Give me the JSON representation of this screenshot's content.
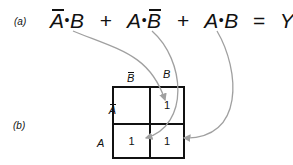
{
  "diagram": {
    "part_a_label": "(a)",
    "part_b_label": "(b)",
    "equation": {
      "term1": {
        "var1": "A",
        "var1_complement": true,
        "dot": "•",
        "var2": "B",
        "var2_complement": false
      },
      "plus1": "+",
      "term2": {
        "var1": "A",
        "var1_complement": false,
        "dot": "•",
        "var2": "B",
        "var2_complement": true
      },
      "plus2": "+",
      "term3": {
        "var1": "A",
        "var1_complement": false,
        "dot": "•",
        "var2": "B",
        "var2_complement": false
      },
      "equals": "=",
      "result": "Y"
    },
    "kmap": {
      "column_headers": [
        "B",
        "B"
      ],
      "column_header_complement": [
        true,
        false
      ],
      "row_headers": [
        "A",
        "A"
      ],
      "row_header_complement": [
        true,
        false
      ],
      "cells": [
        [
          "",
          "1"
        ],
        [
          "1",
          "1"
        ]
      ]
    },
    "arrow_color": "#a0a0a0",
    "arrows": [
      {
        "from": "term1",
        "to": "cell_row0_col1"
      },
      {
        "from": "term2",
        "to": "cell_row1_col0"
      },
      {
        "from": "term3",
        "to": "cell_row1_col1"
      }
    ]
  }
}
